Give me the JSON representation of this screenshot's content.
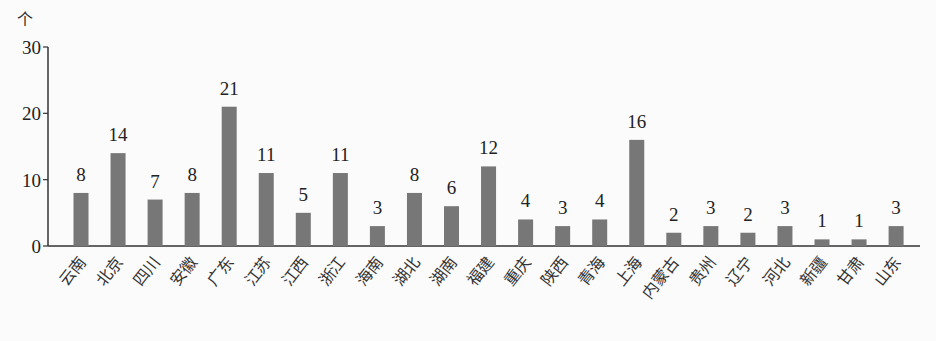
{
  "chart_data": {
    "type": "bar",
    "title": "",
    "xlabel": "",
    "ylabel": "个",
    "ylim": [
      0,
      30
    ],
    "yticks": [
      0,
      10,
      20,
      30
    ],
    "grid": false,
    "legend": null,
    "data_labels": true,
    "bar_color": "#777777",
    "categories": [
      "云南",
      "北京",
      "四川",
      "安徽",
      "广东",
      "江苏",
      "江西",
      "浙江",
      "海南",
      "湖北",
      "湖南",
      "福建",
      "重庆",
      "陕西",
      "青海",
      "上海",
      "内蒙古",
      "贵州",
      "辽宁",
      "河北",
      "新疆",
      "甘肃",
      "山东"
    ],
    "values": [
      8,
      14,
      7,
      8,
      21,
      11,
      5,
      11,
      3,
      8,
      6,
      12,
      4,
      3,
      4,
      16,
      2,
      3,
      2,
      3,
      1,
      1,
      3
    ]
  }
}
